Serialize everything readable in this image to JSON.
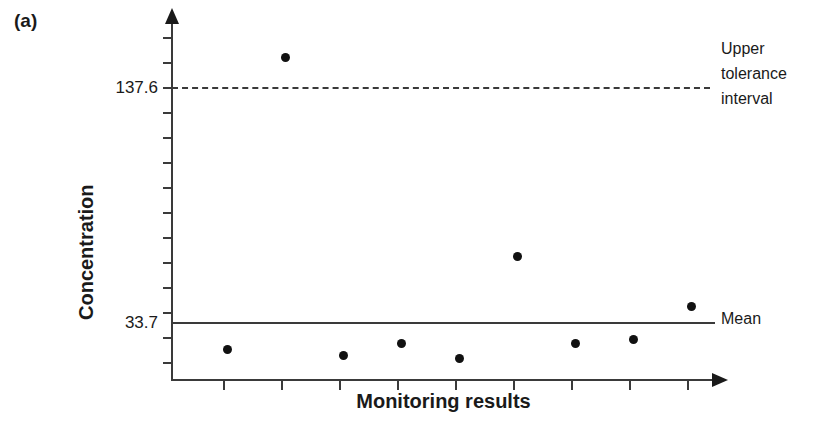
{
  "panel": {
    "label": "(a)"
  },
  "annotations": {
    "tolerance_line1": "Upper",
    "tolerance_line2": "tolerance",
    "tolerance_line3": "interval",
    "mean": "Mean"
  },
  "chart_data": {
    "type": "scatter",
    "title": "",
    "subtitle": "",
    "xlabel": "Monitoring results",
    "ylabel": "Concentration",
    "xlim": [
      0,
      10
    ],
    "ylim": [
      0,
      160
    ],
    "grid": false,
    "legend_position": "right-outside",
    "x_tick_labels": [
      "",
      "",
      "",
      "",
      "",
      "",
      "",
      "",
      ""
    ],
    "y_tick_labels": [
      "33.7",
      "137.6"
    ],
    "y_tick_values": [
      33.7,
      137.6
    ],
    "points": [
      {
        "index": 1,
        "x": 1,
        "y": 22.0
      },
      {
        "index": 2,
        "x": 2,
        "y": 151.0
      },
      {
        "index": 3,
        "x": 3,
        "y": 19.5
      },
      {
        "index": 4,
        "x": 4,
        "y": 24.5
      },
      {
        "index": 5,
        "x": 5,
        "y": 18.0
      },
      {
        "index": 6,
        "x": 6,
        "y": 63.0
      },
      {
        "index": 7,
        "x": 7,
        "y": 24.5
      },
      {
        "index": 8,
        "x": 8,
        "y": 26.5
      },
      {
        "index": 9,
        "x": 9,
        "y": 41.0
      }
    ],
    "reference_lines": [
      {
        "name": "Upper tolerance interval",
        "value": 137.6,
        "style": "dashed",
        "label": "Upper tolerance interval"
      },
      {
        "name": "Mean",
        "value": 33.7,
        "style": "solid",
        "label": "Mean"
      }
    ],
    "colors": {
      "marker": "#111111",
      "axis": "#3a3a3a",
      "text": "#1a1a1a",
      "background": "#ffffff"
    }
  }
}
